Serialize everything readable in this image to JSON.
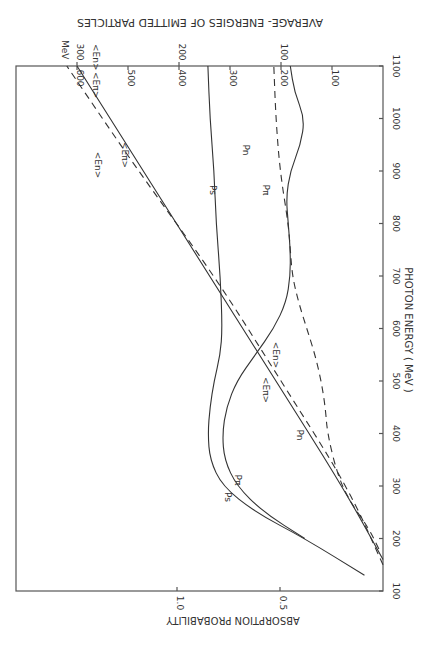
{
  "chart_data": {
    "type": "line",
    "orientation": "rotated-90-clockwise",
    "title": "AVERAGE- ENERGIES OF EMITTED PARTICLES",
    "xlabel": "PHOTON ENERGY ( MeV )",
    "ylabel": "ABSORPTION PROBABILITY",
    "xlim": [
      100,
      1100
    ],
    "ylim": [
      0,
      1.8
    ],
    "x_ticks": [
      "100",
      "200",
      "300",
      "400",
      "500",
      "600",
      "700",
      "800",
      "900",
      "1000",
      "1100"
    ],
    "y_ticks": [
      "0.5",
      "1.0"
    ],
    "secondary_axis": {
      "unit_label": "MeV",
      "scales": [
        {
          "name": "<Eπ>",
          "label": "<Eπ>",
          "ticks": [
            "100",
            "200",
            "300",
            "400",
            "500",
            "600"
          ],
          "range": [
            0,
            600
          ]
        },
        {
          "name": "<En>",
          "label": "<En>",
          "ticks": [
            "100",
            "200",
            "300"
          ],
          "range": [
            0,
            300
          ]
        }
      ]
    },
    "series": [
      {
        "name": "Ps",
        "label": "Ps",
        "style": "solid",
        "axis": "probability",
        "x": [
          130,
          200,
          250,
          300,
          350,
          400,
          450,
          500,
          550,
          600,
          700,
          800,
          900,
          1000,
          1100
        ],
        "y": [
          0.09,
          0.38,
          0.62,
          0.78,
          0.84,
          0.85,
          0.84,
          0.82,
          0.79,
          0.78,
          0.79,
          0.81,
          0.82,
          0.84,
          0.85
        ]
      },
      {
        "name": "Pπ",
        "label": "Pπ",
        "style": "solid",
        "axis": "probability",
        "x": [
          200,
          250,
          300,
          350,
          400,
          450,
          500,
          550,
          600,
          650,
          700,
          750,
          800,
          850,
          900,
          950,
          1000,
          1050,
          1100
        ],
        "y": [
          0.38,
          0.58,
          0.71,
          0.77,
          0.78,
          0.76,
          0.71,
          0.62,
          0.53,
          0.47,
          0.45,
          0.45,
          0.46,
          0.47,
          0.45,
          0.4,
          0.38,
          0.43,
          0.45
        ]
      },
      {
        "name": "Pn",
        "label": "Pn",
        "style": "dashed",
        "axis": "probability",
        "x": [
          180,
          220,
          270,
          320,
          400,
          450,
          500,
          550,
          600,
          650,
          700,
          750,
          800,
          900,
          1000,
          1100
        ],
        "y": [
          0.02,
          0.07,
          0.16,
          0.22,
          0.27,
          0.28,
          0.3,
          0.33,
          0.37,
          0.41,
          0.44,
          0.45,
          0.46,
          0.5,
          0.52,
          0.53
        ]
      },
      {
        "name": "<Eπ>",
        "label": "<Eπ>",
        "style": "solid",
        "axis": "Eπ",
        "x": [
          160,
          300,
          500,
          700,
          900,
          1100
        ],
        "y": [
          0,
          80,
          210,
          340,
          470,
          600
        ]
      },
      {
        "name": "<En>",
        "label": "<En>",
        "style": "dashed",
        "axis": "En",
        "x": [
          150,
          300,
          500,
          700,
          900,
          1100
        ],
        "y": [
          0,
          35,
          100,
          165,
          240,
          310
        ]
      }
    ],
    "annotations": [
      "Ps",
      "Pπ",
      "Pn",
      "<Eπ>",
      "<En>"
    ],
    "grid": false,
    "legend": "none"
  }
}
